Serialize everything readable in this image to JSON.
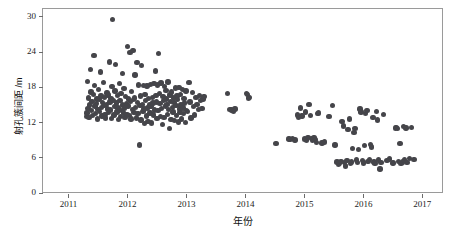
{
  "chart_data": {
    "type": "scatter",
    "title": "",
    "xlabel": "年份",
    "ylabel": "射孔簇间距 /m",
    "xlim": [
      2010.55,
      2017.35
    ],
    "ylim": [
      0,
      31.5
    ],
    "xticks": [
      2011,
      2012,
      2013,
      2014,
      2015,
      2016,
      2017
    ],
    "xtick_labels": [
      "2011",
      "2012",
      "2013",
      "2014",
      "2015",
      "2016",
      "2017"
    ],
    "yticks": [
      0,
      6,
      12,
      18,
      24,
      30
    ],
    "ytick_labels": [
      "0",
      "6",
      "12",
      "18",
      "24",
      "30"
    ],
    "grid": false,
    "legend": null,
    "marker": {
      "shape": "circle",
      "color": "#45454a",
      "size_px": 5.4
    },
    "frame_color": "#9a9a9a",
    "background": "#ffffff",
    "series": [
      {
        "name": "射孔簇间距",
        "points": [
          [
            2011.3,
            13.0
          ],
          [
            2011.31,
            13.6
          ],
          [
            2011.32,
            19.0
          ],
          [
            2011.33,
            14.4
          ],
          [
            2011.34,
            16.2
          ],
          [
            2011.35,
            12.9
          ],
          [
            2011.36,
            15.0
          ],
          [
            2011.37,
            21.0
          ],
          [
            2011.38,
            17.2
          ],
          [
            2011.39,
            14.0
          ],
          [
            2011.4,
            15.6
          ],
          [
            2011.41,
            13.2
          ],
          [
            2011.42,
            16.8
          ],
          [
            2011.43,
            23.4
          ],
          [
            2011.44,
            18.3
          ],
          [
            2011.45,
            14.8
          ],
          [
            2011.46,
            13.5
          ],
          [
            2011.47,
            15.2
          ],
          [
            2011.48,
            16.0
          ],
          [
            2011.49,
            12.6
          ],
          [
            2011.5,
            14.2
          ],
          [
            2011.51,
            17.6
          ],
          [
            2011.52,
            15.9
          ],
          [
            2011.53,
            13.9
          ],
          [
            2011.54,
            20.6
          ],
          [
            2011.55,
            16.5
          ],
          [
            2011.56,
            14.6
          ],
          [
            2011.57,
            13.1
          ],
          [
            2011.58,
            15.4
          ],
          [
            2011.59,
            18.8
          ],
          [
            2011.6,
            14.9
          ],
          [
            2011.61,
            16.3
          ],
          [
            2011.62,
            13.4
          ],
          [
            2011.63,
            12.8
          ],
          [
            2011.64,
            15.1
          ],
          [
            2011.65,
            17.0
          ],
          [
            2011.66,
            14.3
          ],
          [
            2011.67,
            16.7
          ],
          [
            2011.68,
            13.7
          ],
          [
            2011.69,
            22.3
          ],
          [
            2011.7,
            15.5
          ],
          [
            2011.71,
            14.1
          ],
          [
            2011.72,
            16.1
          ],
          [
            2011.73,
            12.7
          ],
          [
            2011.74,
            18.1
          ],
          [
            2011.75,
            29.5
          ],
          [
            2011.76,
            15.8
          ],
          [
            2011.77,
            13.3
          ],
          [
            2011.78,
            14.7
          ],
          [
            2011.79,
            17.4
          ],
          [
            2011.8,
            21.9
          ],
          [
            2011.81,
            15.3
          ],
          [
            2011.82,
            13.8
          ],
          [
            2011.83,
            16.6
          ],
          [
            2011.84,
            14.5
          ],
          [
            2011.85,
            12.5
          ],
          [
            2011.86,
            18.6
          ],
          [
            2011.87,
            15.7
          ],
          [
            2011.88,
            13.0
          ],
          [
            2011.89,
            16.9
          ],
          [
            2011.9,
            14.0
          ],
          [
            2011.91,
            20.3
          ],
          [
            2011.92,
            15.0
          ],
          [
            2011.93,
            13.6
          ],
          [
            2011.94,
            17.8
          ],
          [
            2011.95,
            14.4
          ],
          [
            2011.96,
            12.9
          ],
          [
            2011.97,
            16.4
          ],
          [
            2011.98,
            15.2
          ],
          [
            2011.99,
            13.4
          ],
          [
            2012.0,
            24.9
          ],
          [
            2012.01,
            14.8
          ],
          [
            2012.02,
            16.0
          ],
          [
            2012.03,
            13.2
          ],
          [
            2012.04,
            23.9
          ],
          [
            2012.05,
            15.6
          ],
          [
            2012.06,
            12.6
          ],
          [
            2012.07,
            17.3
          ],
          [
            2012.08,
            14.2
          ],
          [
            2012.09,
            24.3
          ],
          [
            2012.1,
            15.9
          ],
          [
            2012.11,
            13.7
          ],
          [
            2012.12,
            16.2
          ],
          [
            2012.13,
            20.1
          ],
          [
            2012.14,
            14.6
          ],
          [
            2012.15,
            12.8
          ],
          [
            2012.16,
            22.2
          ],
          [
            2012.17,
            15.4
          ],
          [
            2012.18,
            13.5
          ],
          [
            2012.19,
            18.4
          ],
          [
            2012.2,
            8.2
          ],
          [
            2012.21,
            14.9
          ],
          [
            2012.22,
            16.5
          ],
          [
            2012.23,
            12.4
          ],
          [
            2012.24,
            21.7
          ],
          [
            2012.25,
            15.1
          ],
          [
            2012.26,
            13.9
          ],
          [
            2012.27,
            18.3
          ],
          [
            2012.28,
            14.3
          ],
          [
            2012.29,
            11.8
          ],
          [
            2012.3,
            16.8
          ],
          [
            2012.31,
            15.7
          ],
          [
            2012.32,
            13.1
          ],
          [
            2012.33,
            18.2
          ],
          [
            2012.34,
            14.5
          ],
          [
            2012.35,
            12.2
          ],
          [
            2012.36,
            16.1
          ],
          [
            2012.37,
            15.0
          ],
          [
            2012.38,
            13.6
          ],
          [
            2012.39,
            18.5
          ],
          [
            2012.4,
            14.7
          ],
          [
            2012.41,
            11.9
          ],
          [
            2012.42,
            16.3
          ],
          [
            2012.43,
            15.3
          ],
          [
            2012.44,
            13.3
          ],
          [
            2012.45,
            18.6
          ],
          [
            2012.46,
            14.1
          ],
          [
            2012.47,
            20.8
          ],
          [
            2012.48,
            16.6
          ],
          [
            2012.49,
            15.5
          ],
          [
            2012.5,
            12.7
          ],
          [
            2012.51,
            18.4
          ],
          [
            2012.52,
            14.0
          ],
          [
            2012.53,
            23.8
          ],
          [
            2012.54,
            16.9
          ],
          [
            2012.55,
            15.2
          ],
          [
            2012.56,
            13.0
          ],
          [
            2012.57,
            18.7
          ],
          [
            2012.58,
            14.4
          ],
          [
            2012.59,
            11.7
          ],
          [
            2012.6,
            16.4
          ],
          [
            2012.61,
            15.8
          ],
          [
            2012.62,
            12.9
          ],
          [
            2012.63,
            18.1
          ],
          [
            2012.64,
            14.8
          ],
          [
            2012.65,
            17.5
          ],
          [
            2012.66,
            16.0
          ],
          [
            2012.67,
            15.1
          ],
          [
            2012.68,
            13.4
          ],
          [
            2012.69,
            18.9
          ],
          [
            2012.7,
            14.2
          ],
          [
            2012.71,
            11.0
          ],
          [
            2012.72,
            16.7
          ],
          [
            2012.73,
            15.6
          ],
          [
            2012.74,
            12.5
          ],
          [
            2012.75,
            17.2
          ],
          [
            2012.76,
            14.6
          ],
          [
            2012.77,
            13.8
          ],
          [
            2012.78,
            16.2
          ],
          [
            2012.79,
            15.4
          ],
          [
            2012.8,
            12.3
          ],
          [
            2012.81,
            17.9
          ],
          [
            2012.82,
            14.9
          ],
          [
            2012.83,
            13.2
          ],
          [
            2012.84,
            16.5
          ],
          [
            2012.85,
            15.9
          ],
          [
            2012.86,
            12.1
          ],
          [
            2012.87,
            18.0
          ],
          [
            2012.88,
            14.3
          ],
          [
            2012.89,
            13.7
          ],
          [
            2012.9,
            16.8
          ],
          [
            2012.91,
            15.0
          ],
          [
            2012.92,
            12.6
          ],
          [
            2012.93,
            17.6
          ],
          [
            2012.94,
            14.5
          ],
          [
            2012.95,
            13.5
          ],
          [
            2012.96,
            16.1
          ],
          [
            2012.97,
            15.3
          ],
          [
            2012.98,
            12.0
          ],
          [
            2012.99,
            17.4
          ],
          [
            2013.0,
            14.0
          ],
          [
            2013.02,
            13.9
          ],
          [
            2013.04,
            18.8
          ],
          [
            2013.06,
            15.5
          ],
          [
            2013.08,
            12.8
          ],
          [
            2013.1,
            17.1
          ],
          [
            2013.12,
            14.7
          ],
          [
            2013.14,
            13.3
          ],
          [
            2013.16,
            16.3
          ],
          [
            2013.18,
            15.1
          ],
          [
            2013.2,
            14.2
          ],
          [
            2013.22,
            16.6
          ],
          [
            2013.24,
            15.8
          ],
          [
            2013.26,
            14.4
          ],
          [
            2013.28,
            16.0
          ],
          [
            2013.3,
            16.4
          ],
          [
            2013.7,
            16.9
          ],
          [
            2013.74,
            14.2
          ],
          [
            2013.76,
            14.1
          ],
          [
            2013.78,
            14.0
          ],
          [
            2013.8,
            13.9
          ],
          [
            2013.82,
            14.3
          ],
          [
            2014.02,
            16.9
          ],
          [
            2014.03,
            16.8
          ],
          [
            2014.05,
            16.2
          ],
          [
            2014.07,
            16.3
          ],
          [
            2014.52,
            8.4
          ],
          [
            2014.74,
            9.2
          ],
          [
            2014.76,
            9.1
          ],
          [
            2014.8,
            9.3
          ],
          [
            2014.84,
            9.0
          ],
          [
            2014.88,
            13.3
          ],
          [
            2014.9,
            12.9
          ],
          [
            2014.93,
            14.5
          ],
          [
            2014.96,
            13.1
          ],
          [
            2015.0,
            9.2
          ],
          [
            2015.02,
            13.8
          ],
          [
            2015.04,
            9.0
          ],
          [
            2015.06,
            9.4
          ],
          [
            2015.08,
            15.1
          ],
          [
            2015.1,
            13.2
          ],
          [
            2015.12,
            9.3
          ],
          [
            2015.14,
            8.9
          ],
          [
            2015.16,
            9.5
          ],
          [
            2015.18,
            9.1
          ],
          [
            2015.2,
            8.6
          ],
          [
            2015.22,
            13.5
          ],
          [
            2015.24,
            13.6
          ],
          [
            2015.3,
            8.5
          ],
          [
            2015.34,
            8.7
          ],
          [
            2015.42,
            13.0
          ],
          [
            2015.48,
            14.9
          ],
          [
            2015.52,
            8.2
          ],
          [
            2015.55,
            5.3
          ],
          [
            2015.58,
            4.9
          ],
          [
            2015.6,
            5.1
          ],
          [
            2015.62,
            5.4
          ],
          [
            2015.64,
            12.2
          ],
          [
            2015.66,
            11.4
          ],
          [
            2015.68,
            5.2
          ],
          [
            2015.7,
            4.6
          ],
          [
            2015.72,
            5.5
          ],
          [
            2015.74,
            10.8
          ],
          [
            2015.76,
            12.6
          ],
          [
            2015.78,
            5.0
          ],
          [
            2015.8,
            5.3
          ],
          [
            2015.82,
            7.6
          ],
          [
            2015.84,
            10.3
          ],
          [
            2015.86,
            11.0
          ],
          [
            2015.88,
            5.6
          ],
          [
            2015.9,
            5.2
          ],
          [
            2015.92,
            7.4
          ],
          [
            2015.94,
            14.3
          ],
          [
            2015.96,
            13.8
          ],
          [
            2015.98,
            5.5
          ],
          [
            2016.0,
            5.1
          ],
          [
            2016.02,
            8.1
          ],
          [
            2016.04,
            13.5
          ],
          [
            2016.06,
            14.0
          ],
          [
            2016.08,
            5.4
          ],
          [
            2016.1,
            5.7
          ],
          [
            2016.12,
            8.3
          ],
          [
            2016.14,
            7.8
          ],
          [
            2016.16,
            12.9
          ],
          [
            2016.18,
            5.3
          ],
          [
            2016.2,
            5.0
          ],
          [
            2016.22,
            13.9
          ],
          [
            2016.24,
            12.4
          ],
          [
            2016.26,
            5.6
          ],
          [
            2016.28,
            4.1
          ],
          [
            2016.3,
            5.2
          ],
          [
            2016.34,
            13.4
          ],
          [
            2016.4,
            5.5
          ],
          [
            2016.44,
            5.8
          ],
          [
            2016.5,
            5.1
          ],
          [
            2016.54,
            11.1
          ],
          [
            2016.56,
            11.2
          ],
          [
            2016.58,
            11.0
          ],
          [
            2016.6,
            5.4
          ],
          [
            2016.62,
            8.4
          ],
          [
            2016.64,
            5.0
          ],
          [
            2016.66,
            5.3
          ],
          [
            2016.68,
            11.3
          ],
          [
            2016.7,
            5.6
          ],
          [
            2016.72,
            11.1
          ],
          [
            2016.74,
            5.2
          ],
          [
            2016.78,
            5.9
          ],
          [
            2016.82,
            11.2
          ],
          [
            2016.86,
            5.7
          ]
        ]
      }
    ]
  }
}
